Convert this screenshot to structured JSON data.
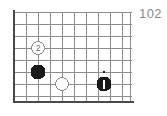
{
  "diagram": {
    "number_label": "102",
    "number_color": "#8a8a8a",
    "type": "go-board-corner",
    "background_color": "#ffffff",
    "grid": {
      "line_color": "#8c8c8c",
      "edge_color": "#4a4a4a",
      "spacing_px": 12,
      "origin_x": 14,
      "origin_y": 12,
      "columns": 10,
      "rows": 8,
      "left_edge_thick": true,
      "bottom_edge_thick": true,
      "top_edge_thick": false,
      "right_edge_thick": false
    },
    "stones": [
      {
        "id": "stone-white-2",
        "color": "white",
        "fill": "#ffffff",
        "stroke": "#8c8c8c",
        "col": 2,
        "row": 3,
        "cx": 38,
        "cy": 48,
        "radius": 6.5,
        "label": "2",
        "label_color": "#6e6e6e",
        "marker": "none"
      },
      {
        "id": "stone-black-a",
        "color": "black",
        "fill": "#1a1a1a",
        "stroke": "#1a1a1a",
        "col": 2,
        "row": 5,
        "cx": 38,
        "cy": 72,
        "radius": 7,
        "label": "",
        "label_color": "#ffffff",
        "marker": "none"
      },
      {
        "id": "stone-white-b",
        "color": "white",
        "fill": "#ffffff",
        "stroke": "#8c8c8c",
        "col": 4,
        "row": 6,
        "cx": 62,
        "cy": 84,
        "radius": 6.5,
        "label": "",
        "label_color": "#6e6e6e",
        "marker": "none"
      },
      {
        "id": "stone-black-last-move",
        "color": "black",
        "fill": "#1a1a1a",
        "stroke": "#1a1a1a",
        "col": 8,
        "row": 6,
        "cx": 104,
        "cy": 84,
        "radius": 7,
        "label": "",
        "label_color": "#ffffff",
        "marker": "vertical-tick"
      }
    ],
    "star_points": [
      {
        "id": "star-point-1",
        "cx": 104,
        "cy": 72,
        "radius": 1.2,
        "color": "#1a1a1a"
      }
    ]
  }
}
